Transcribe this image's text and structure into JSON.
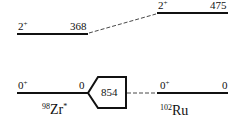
{
  "diagram": {
    "type": "energy-level-scheme",
    "left_nucleus": {
      "mass": "98",
      "symbol": "Zr",
      "suffix": "*",
      "levels": [
        {
          "spin": "2",
          "parity": "+",
          "energy": "368"
        },
        {
          "spin": "0",
          "parity": "+",
          "energy": "0"
        }
      ]
    },
    "right_nucleus": {
      "mass": "102",
      "symbol": "Ru",
      "levels": [
        {
          "spin": "2",
          "parity": "+",
          "energy": "475"
        },
        {
          "spin": "0",
          "parity": "+",
          "energy": "0"
        }
      ]
    },
    "offset_box": {
      "value": "854"
    },
    "colors": {
      "line": "#111111",
      "background": "#ffffff"
    }
  }
}
